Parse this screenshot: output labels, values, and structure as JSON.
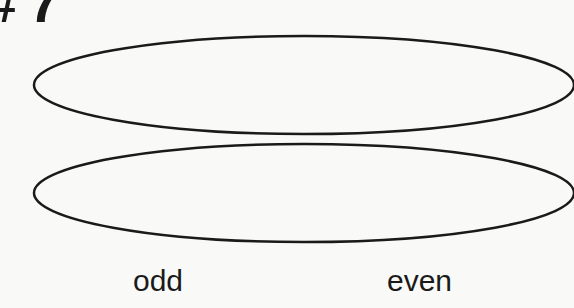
{
  "heading": {
    "text": "# 7"
  },
  "diagram": {
    "shapes": [
      {
        "type": "ellipse",
        "name": "top-oval"
      },
      {
        "type": "ellipse",
        "name": "bottom-oval"
      }
    ],
    "stroke_color": "#1a1a1a"
  },
  "labels": {
    "odd": "odd",
    "even": "even"
  }
}
